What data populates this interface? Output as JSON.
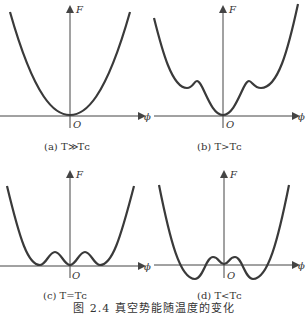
{
  "figure": {
    "caption": "图 2.4   真空势能随温度的变化",
    "axis_labels": {
      "y": "F",
      "x": "ϕ",
      "origin": "O"
    },
    "panels": [
      {
        "id": "a",
        "label": "(a)  T≫Tᴄ",
        "condition": "T≫Tc",
        "shape": "single-well parabola"
      },
      {
        "id": "b",
        "label": "(b)  T>Tᴄ",
        "condition": "T>Tc",
        "shape": "global minimum at origin with two higher local minima"
      },
      {
        "id": "c",
        "label": "(c)  T=Tᴄ",
        "condition": "T=Tc",
        "shape": "three degenerate minima at F=0"
      },
      {
        "id": "d",
        "label": "(d)  T<Tᴄ",
        "condition": "T<Tc",
        "shape": "origin becomes metastable; two lower minima below axis"
      }
    ]
  },
  "colors": {
    "curve": "#3a3a3a",
    "axis": "#444444",
    "text": "#333333"
  }
}
